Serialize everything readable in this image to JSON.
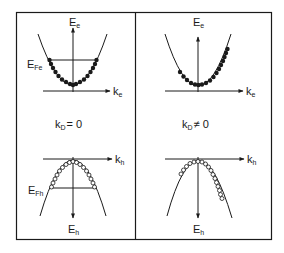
{
  "figure": {
    "type": "band-diagram",
    "panels": [
      {
        "id": "left",
        "condition": {
          "base": "k",
          "sub": "D",
          "rel": "= 0"
        },
        "conduction_band": {
          "energy_axis": {
            "base": "E",
            "sub": "e"
          },
          "momentum_axis": {
            "base": "k",
            "sub": "e"
          },
          "fermi_level": {
            "base": "E",
            "sub": "Fe"
          },
          "filling": "symmetric, filled dots up to Fermi level"
        },
        "valence_band": {
          "energy_axis": {
            "base": "E",
            "sub": "h"
          },
          "momentum_axis": {
            "base": "k",
            "sub": "h"
          },
          "fermi_level": {
            "base": "E",
            "sub": "Fh"
          },
          "filling": "symmetric, open circles down to Fermi level"
        }
      },
      {
        "id": "right",
        "condition": {
          "base": "k",
          "sub": "D",
          "rel": "≠ 0"
        },
        "conduction_band": {
          "energy_axis": {
            "base": "E",
            "sub": "e"
          },
          "momentum_axis": {
            "base": "k",
            "sub": "e"
          },
          "filling": "asymmetric, shifted to +k"
        },
        "valence_band": {
          "energy_axis": {
            "base": "E",
            "sub": "h"
          },
          "momentum_axis": {
            "base": "k",
            "sub": "h"
          },
          "filling": "asymmetric, shifted to +k"
        }
      }
    ]
  },
  "colors": {
    "ink": "#1a1a1a",
    "background": "#ffffff"
  }
}
